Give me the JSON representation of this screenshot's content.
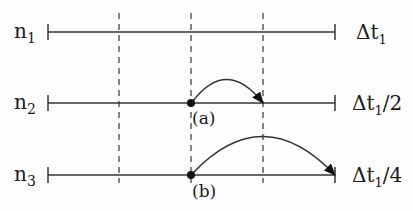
{
  "figure": {
    "type": "timestep-subcycling-diagram",
    "colors": {
      "line": "#333333",
      "dash": "#444444",
      "dot": "#111111",
      "text": "#1a1a1a",
      "background": "#fdfdfd"
    },
    "geometry": {
      "x_start": 48,
      "x_end": 335,
      "dashed_x": [
        119,
        191,
        263
      ],
      "dashed_top": 13,
      "dashed_bottom": 183
    },
    "levels": [
      {
        "name": "n1",
        "label_main": "n",
        "label_sub": "1",
        "y": 32,
        "timestep_label_main": "Δt",
        "timestep_label_sub": "1",
        "timestep_label_suffix": ""
      },
      {
        "name": "n2",
        "label_main": "n",
        "label_sub": "2",
        "y": 103,
        "timestep_label_main": "Δt",
        "timestep_label_sub": "1",
        "timestep_label_suffix": "/2"
      },
      {
        "name": "n3",
        "label_main": "n",
        "label_sub": "3",
        "y": 175,
        "timestep_label_main": "Δt",
        "timestep_label_sub": "1",
        "timestep_label_suffix": "/4"
      }
    ],
    "arrows": [
      {
        "id": "a",
        "label": "(a)",
        "level": "n2",
        "from_x": 191,
        "to_x": 263,
        "y": 103,
        "peak_y": 80
      },
      {
        "id": "b",
        "label": "(b)",
        "level": "n3",
        "from_x": 191,
        "to_x": 335,
        "y": 175,
        "peak_y": 137
      }
    ]
  }
}
